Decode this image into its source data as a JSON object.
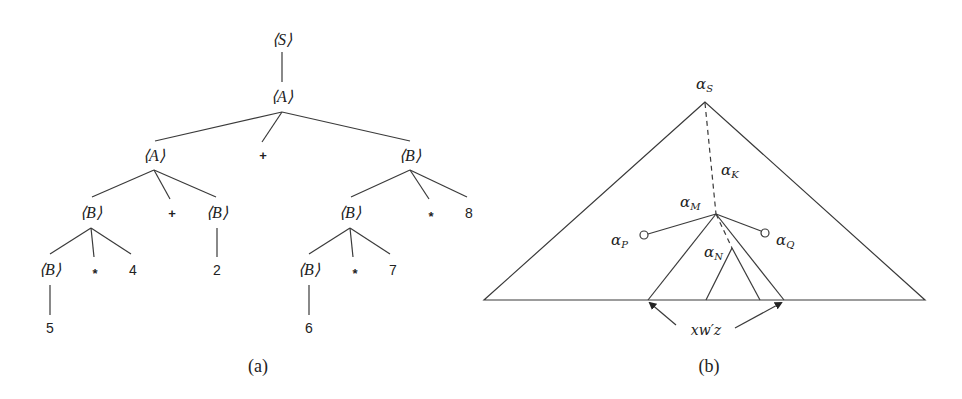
{
  "figure_a": {
    "caption": "(a)",
    "nodes": {
      "root": "⟨S⟩",
      "a1": "⟨A⟩",
      "a2": "⟨A⟩",
      "plus_top": "+",
      "b_right": "⟨B⟩",
      "b_l3_left": "⟨B⟩",
      "plus_l3": "+",
      "b_l3_mid": "⟨B⟩",
      "b_r3": "⟨B⟩",
      "star_r3": "*",
      "num_8": "8",
      "b_l4": "⟨B⟩",
      "star_l4": "*",
      "num_4": "4",
      "num_2": "2",
      "b_r4": "⟨B⟩",
      "star_r4": "*",
      "num_7": "7",
      "num_5": "5",
      "num_6": "6"
    }
  },
  "figure_b": {
    "caption": "(b)",
    "labels": {
      "alpha": "α",
      "S": "S",
      "K": "K",
      "M": "M",
      "N": "N",
      "P": "P",
      "Q": "Q",
      "string": "xw′z"
    }
  }
}
